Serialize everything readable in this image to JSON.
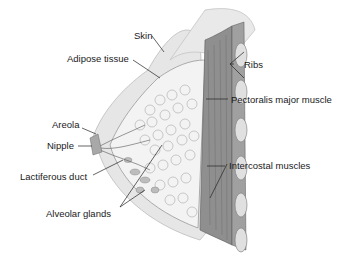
{
  "diagram": {
    "labels": {
      "skin": "Skin",
      "adipose": "Adipose tissue",
      "ribs": "Ribs",
      "pectoralis": "Pectoralis major muscle",
      "areola": "Areola",
      "nipple": "Nipple",
      "lactiferous": "Lactiferous duct",
      "intercostal": "Intercostal muscles",
      "alveolar": "Alveolar glands"
    },
    "colors": {
      "skin": "#e4e4e4",
      "adipose": "#f2f2f2",
      "gland": "#b8b8b8",
      "muscle": "#8a8a8a",
      "rib": "#dcdcdc",
      "line": "#222222"
    }
  }
}
